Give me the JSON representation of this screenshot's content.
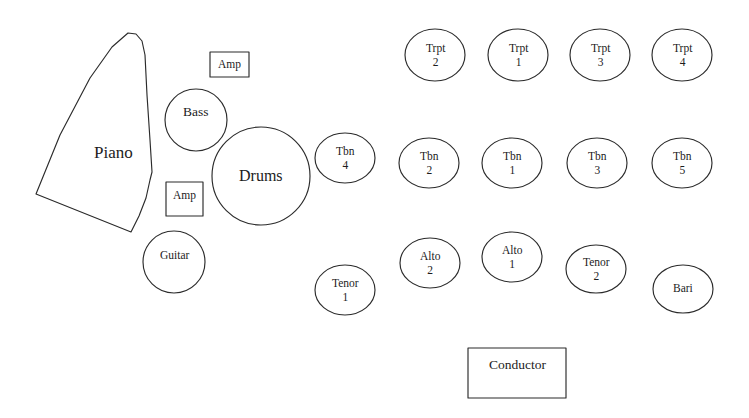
{
  "diagram": {
    "stroke_color": "#2b2b2b",
    "fill_color": "#ffffff",
    "text_color": "#1c1c1c",
    "width": 749,
    "height": 418
  },
  "sections": {
    "trumpets": {
      "name": "Trumpet Section",
      "seats": [
        {
          "id": "trpt-2",
          "instrument": "Trpt",
          "chair": "2",
          "cx": 435,
          "cy": 55,
          "rx": 30,
          "ry": 26
        },
        {
          "id": "trpt-1",
          "instrument": "Trpt",
          "chair": "1",
          "cx": 518,
          "cy": 55,
          "rx": 30,
          "ry": 26
        },
        {
          "id": "trpt-3",
          "instrument": "Trpt",
          "chair": "3",
          "cx": 600,
          "cy": 55,
          "rx": 30,
          "ry": 26
        },
        {
          "id": "trpt-4",
          "instrument": "Trpt",
          "chair": "4",
          "cx": 682,
          "cy": 55,
          "rx": 30,
          "ry": 26
        }
      ]
    },
    "trombones": {
      "name": "Trombone Section",
      "seats": [
        {
          "id": "tbn-4",
          "instrument": "Tbn",
          "chair": "4",
          "cx": 345,
          "cy": 158,
          "rx": 30,
          "ry": 25
        },
        {
          "id": "tbn-2",
          "instrument": "Tbn",
          "chair": "2",
          "cx": 429,
          "cy": 163,
          "rx": 30,
          "ry": 25
        },
        {
          "id": "tbn-1",
          "instrument": "Tbn",
          "chair": "1",
          "cx": 512,
          "cy": 163,
          "rx": 30,
          "ry": 25
        },
        {
          "id": "tbn-3",
          "instrument": "Tbn",
          "chair": "3",
          "cx": 597,
          "cy": 163,
          "rx": 30,
          "ry": 25
        },
        {
          "id": "tbn-5",
          "instrument": "Tbn",
          "chair": "5",
          "cx": 682,
          "cy": 163,
          "rx": 30,
          "ry": 25
        }
      ]
    },
    "saxophones": {
      "name": "Saxophone Section",
      "seats": [
        {
          "id": "tenor-1",
          "instrument": "Tenor",
          "chair": "1",
          "cx": 345,
          "cy": 290,
          "rx": 30,
          "ry": 25
        },
        {
          "id": "alto-2",
          "instrument": "Alto",
          "chair": "2",
          "cx": 430,
          "cy": 263,
          "rx": 30,
          "ry": 25
        },
        {
          "id": "alto-1",
          "instrument": "Alto",
          "chair": "1",
          "cx": 512,
          "cy": 257,
          "rx": 30,
          "ry": 25
        },
        {
          "id": "tenor-2",
          "instrument": "Tenor",
          "chair": "2",
          "cx": 596,
          "cy": 269,
          "rx": 30,
          "ry": 24
        },
        {
          "id": "bari",
          "instrument": "Bari",
          "chair": "",
          "cx": 683,
          "cy": 289,
          "rx": 30,
          "ry": 24
        }
      ]
    },
    "rhythm": {
      "name": "Rhythm Section",
      "piano": {
        "id": "piano",
        "label": "Piano",
        "label_x": 79,
        "label_y": 145,
        "points": "128,33 136,34 142,41 145,55 147,95 150,140 152,172 150,180 146,198 139,216 131,232 36,194 60,135 90,78 112,47"
      },
      "bass": {
        "id": "bass",
        "label": "Bass",
        "cx": 196,
        "cy": 120,
        "r": 31
      },
      "drums": {
        "id": "drums",
        "label": "Drums",
        "cx": 261,
        "cy": 176,
        "r": 49
      },
      "guitar": {
        "id": "guitar",
        "label": "Guitar",
        "cx": 174,
        "cy": 262,
        "r": 31
      },
      "amps": [
        {
          "id": "amp-top",
          "label": "Amp",
          "x": 210,
          "y": 52,
          "w": 39,
          "h": 25
        },
        {
          "id": "amp-bottom",
          "label": "Amp",
          "x": 166,
          "y": 182,
          "w": 37,
          "h": 34
        }
      ]
    },
    "conductor": {
      "id": "conductor",
      "label": "Conductor",
      "x": 468,
      "y": 348,
      "w": 98,
      "h": 50
    }
  }
}
